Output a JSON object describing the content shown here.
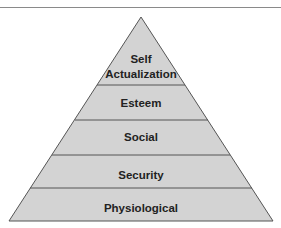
{
  "diagram": {
    "type": "pyramid",
    "title_cutoff": true,
    "colors": {
      "fill": "#d3d3d3",
      "stroke": "#555555",
      "text": "#222222",
      "rule": "#8a8a8a"
    },
    "layers": [
      {
        "id": "self-actualization",
        "lines": [
          "Self",
          "Actualization"
        ]
      },
      {
        "id": "esteem",
        "lines": [
          "Esteem"
        ]
      },
      {
        "id": "social",
        "lines": [
          "Social"
        ]
      },
      {
        "id": "security",
        "lines": [
          "Security"
        ]
      },
      {
        "id": "physiological",
        "lines": [
          "Physiological"
        ]
      }
    ]
  }
}
